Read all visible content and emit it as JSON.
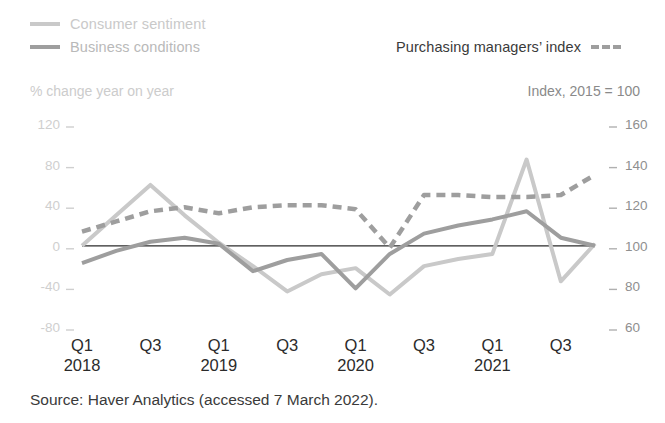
{
  "legend": {
    "consumer": {
      "label": "Consumer sentiment",
      "color": "#c9c9c9",
      "style": "solid"
    },
    "business": {
      "label": "Business conditions",
      "color": "#9e9e9e",
      "style": "solid"
    },
    "pmi": {
      "label": "Purchasing managers’ index",
      "color": "#9e9e9e",
      "style": "dashed"
    }
  },
  "axis_captions": {
    "left": "% change year on year",
    "right": "Index, 2015 = 100"
  },
  "source": "Source: Haver Analytics (accessed 7 March 2022).",
  "chart_data": {
    "type": "line",
    "title": "",
    "xlabel": "",
    "ylabel": "% change year on year",
    "y2label": "Index, 2015 = 100",
    "grid": false,
    "legend_position": "top",
    "x": [
      "Q1 2018",
      "Q2 2018",
      "Q3 2018",
      "Q4 2018",
      "Q1 2019",
      "Q2 2019",
      "Q3 2019",
      "Q4 2019",
      "Q1 2020",
      "Q2 2020",
      "Q3 2020",
      "Q4 2020",
      "Q1 2021",
      "Q2 2021",
      "Q3 2021",
      "Q4 2021"
    ],
    "major_tick_labels": [
      {
        "q": "Q1",
        "year": "2018"
      },
      {
        "q": "Q3",
        "year": ""
      },
      {
        "q": "Q1",
        "year": "2019"
      },
      {
        "q": "Q3",
        "year": ""
      },
      {
        "q": "Q1",
        "year": "2020"
      },
      {
        "q": "Q3",
        "year": ""
      },
      {
        "q": "Q1",
        "year": "2021"
      },
      {
        "q": "Q3",
        "year": ""
      }
    ],
    "yticks_left": [
      120,
      80,
      40,
      0,
      -40,
      -80
    ],
    "ylim": [
      -100,
      120
    ],
    "yticks_right": [
      160,
      140,
      120,
      100,
      80,
      60
    ],
    "y2lim": [
      50,
      160
    ],
    "series": [
      {
        "name": "Consumer sentiment",
        "axis": "left",
        "color": "#c9c9c9",
        "style": "solid",
        "width": 4,
        "values": [
          0,
          30,
          60,
          30,
          3,
          -20,
          -45,
          -28,
          -22,
          -48,
          -20,
          -13,
          -8,
          85,
          -35,
          2
        ]
      },
      {
        "name": "Business conditions",
        "axis": "left",
        "color": "#9e9e9e",
        "style": "solid",
        "width": 4,
        "values": [
          -17,
          -5,
          4,
          8,
          2,
          -25,
          -14,
          -8,
          -42,
          -8,
          12,
          20,
          26,
          34,
          8,
          0
        ]
      },
      {
        "name": "Purchasing managers’ index",
        "axis": "right",
        "color": "#9e9e9e",
        "style": "dashed",
        "width": 4.5,
        "values": [
          107,
          112,
          117,
          119,
          116,
          119,
          120,
          120,
          118,
          99,
          125,
          125,
          124,
          124,
          125,
          135
        ]
      }
    ],
    "zero_line": true
  }
}
